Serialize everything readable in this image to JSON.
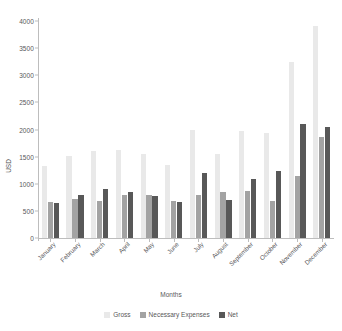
{
  "chart_data": {
    "type": "bar",
    "title": "",
    "xlabel": "Months",
    "ylabel": "USD",
    "ylim": [
      0,
      4000
    ],
    "yticks": [
      0,
      500,
      1000,
      1500,
      2000,
      2500,
      3000,
      3500,
      4000
    ],
    "grid": false,
    "legend_position": "bottom",
    "categories": [
      "January",
      "February",
      "March",
      "April",
      "May",
      "June",
      "July",
      "August",
      "September",
      "October",
      "November",
      "December"
    ],
    "series": [
      {
        "name": "Gross",
        "color": "#e9e9e9",
        "values": [
          1330,
          1520,
          1600,
          1630,
          1550,
          1350,
          2000,
          1540,
          1980,
          1940,
          3250,
          3900
        ]
      },
      {
        "name": "Necessary Expenses",
        "color": "#a3a3a3",
        "values": [
          670,
          720,
          690,
          790,
          790,
          680,
          790,
          840,
          870,
          690,
          1150,
          1860
        ]
      },
      {
        "name": "Net",
        "color": "#585858",
        "values": [
          650,
          790,
          910,
          840,
          770,
          670,
          1200,
          700,
          1090,
          1240,
          2110,
          2040
        ]
      }
    ]
  },
  "colors": {
    "gross": "#e9e9e9",
    "necessary_expenses": "#a3a3a3",
    "net": "#585858",
    "axis": "#bdbdbd",
    "text": "#58585a",
    "background": "#ffffff"
  }
}
